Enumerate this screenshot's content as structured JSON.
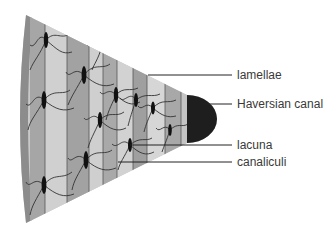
{
  "diagram": {
    "labels": [
      {
        "id": "lamellae",
        "text": "lamellae",
        "y": 75
      },
      {
        "id": "haversian-canal",
        "text": "Haversian canal",
        "y": 104
      },
      {
        "id": "lacuna",
        "text": "lacuna",
        "y": 145
      },
      {
        "id": "canaliculi",
        "text": "canaliculi",
        "y": 162
      }
    ],
    "colors": {
      "outer_rim": "#8c8c8c",
      "lamella_light": "#cdcdcd",
      "lamella_mid": "#b0b0b0",
      "lamella_dark": "#9a9a9a",
      "canal": "#1e1e1e",
      "lacuna": "#111111",
      "canaliculi": "#333333",
      "leader_line": "#222222"
    }
  }
}
